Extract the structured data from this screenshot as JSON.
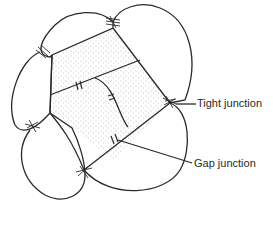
{
  "diagram": {
    "labels": {
      "tight_junction": "Tight junction",
      "gap_junction": "Gap junction"
    },
    "colors": {
      "line": "#2a2a2a",
      "stipple": "#777777",
      "background": "#ffffff"
    }
  }
}
